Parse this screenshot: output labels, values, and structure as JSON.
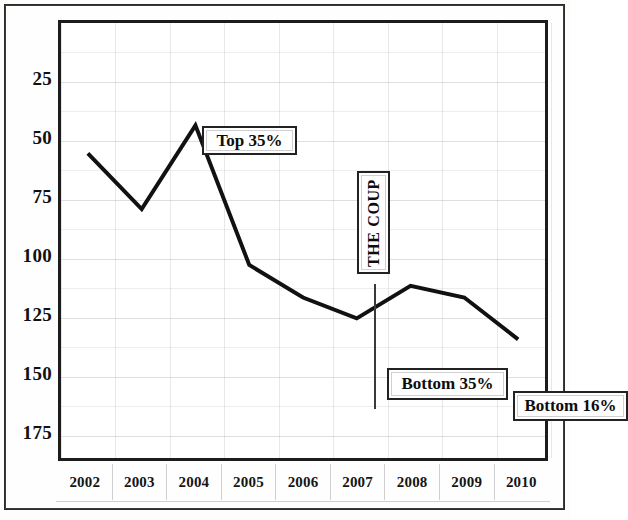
{
  "chart_data": {
    "type": "line",
    "title": "",
    "subtitle": "",
    "xlabel": "",
    "ylabel": "",
    "categories": [
      "2002",
      "2003",
      "2004",
      "2005",
      "2006",
      "2007",
      "2008",
      "2009",
      "2010"
    ],
    "values": [
      56,
      80,
      44,
      104,
      118,
      127,
      113,
      118,
      136
    ],
    "series": [
      {
        "name": "Ranking",
        "values": [
          56,
          80,
          44,
          104,
          118,
          127,
          113,
          118,
          136
        ]
      }
    ],
    "ylim": [
      0,
      187
    ],
    "y_inverted": true,
    "y_ticks": [
      25,
      50,
      75,
      100,
      125,
      150,
      175
    ],
    "y_tick_labels": [
      "25",
      "50",
      "75",
      "100",
      "125",
      "150",
      "175"
    ],
    "x_ticks": [
      "2002",
      "2003",
      "2004",
      "2005",
      "2006",
      "2007",
      "2008",
      "2009",
      "2010"
    ],
    "grid": true,
    "legend": "none",
    "line_color": "#111111",
    "annotations": [
      {
        "id": "top35",
        "text": "Top 35%",
        "x": "2004",
        "value": 44
      },
      {
        "id": "coup",
        "text": "THE COUP",
        "x": "2006",
        "orientation": "vertical"
      },
      {
        "id": "bottom35",
        "text": "Bottom 35%",
        "x": "2007",
        "value": 127
      },
      {
        "id": "bottom16",
        "text": "Bottom 16%",
        "x": "2010",
        "value": 136
      }
    ]
  },
  "axes": {
    "y_labels": [
      "25",
      "50",
      "75",
      "100",
      "125",
      "150",
      "175"
    ],
    "x_labels": [
      "2002",
      "2003",
      "2004",
      "2005",
      "2006",
      "2007",
      "2008",
      "2009",
      "2010"
    ]
  },
  "annotations": {
    "top35": "Top 35%",
    "coup": "THE COUP",
    "bottom35": "Bottom 35%",
    "bottom16": "Bottom 16%"
  },
  "colors": {
    "line": "#111111",
    "frame": "#1c1c1c",
    "grid": "#969696",
    "text": "#111111",
    "background": "#ffffff"
  }
}
